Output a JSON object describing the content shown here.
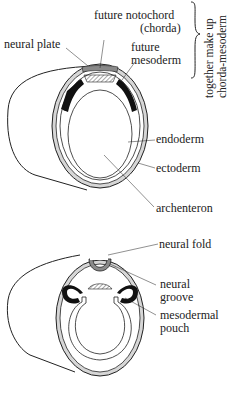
{
  "diagram": {
    "top_figure": {
      "labels": {
        "future_notochord": "future notochord",
        "chorda": "(chorda)",
        "future_mesoderm_1": "future",
        "future_mesoderm_2": "mesoderm",
        "neural_plate": "neural plate",
        "endoderm": "endoderm",
        "ectoderm": "ectoderm",
        "archenteron": "archenteron"
      },
      "brace_note": {
        "line1": "together make up",
        "line2": "chorda-mesoderm"
      }
    },
    "bottom_figure": {
      "labels": {
        "neural_fold": "neural fold",
        "neural_groove_1": "neural",
        "neural_groove_2": "groove",
        "mesodermal_pouch_1": "mesodermal",
        "mesodermal_pouch_2": "pouch"
      }
    },
    "colors": {
      "ectoderm_fill": "#d6d6d6",
      "mesoderm_fill": "#111111",
      "neural_plate_fill": "#8a8a8a",
      "line": "#222222"
    }
  }
}
